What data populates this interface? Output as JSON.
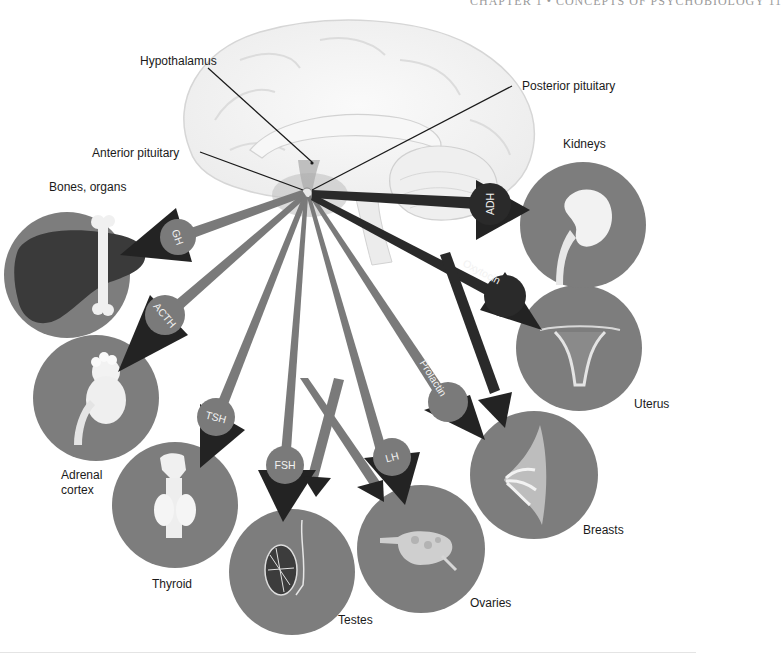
{
  "page": {
    "running_head": "CHAPTER 1 • CONCEPTS OF PSYCHOBIOLOGY    11"
  },
  "brain": {
    "labels": {
      "hypothalamus": "Hypothalamus",
      "anterior_pituitary": "Anterior pituitary",
      "posterior_pituitary": "Posterior pituitary"
    }
  },
  "colors": {
    "anterior_hormone": "#7a7a7a",
    "posterior_hormone": "#2a2a2a",
    "arrowhead": "#232323",
    "target_circle": "#7d7d7d",
    "brain_fill": "#f4f4f4",
    "brain_outline": "#d8d8d8",
    "label_text": "#1a1a1a"
  },
  "hormones": [
    {
      "id": "gh",
      "label": "GH",
      "source": "anterior",
      "target": "Bones, organs"
    },
    {
      "id": "acth",
      "label": "ACTH",
      "source": "anterior",
      "target": "Adrenal cortex"
    },
    {
      "id": "tsh",
      "label": "TSH",
      "source": "anterior",
      "target": "Thyroid"
    },
    {
      "id": "fsh",
      "label": "FSH",
      "source": "anterior",
      "target": "Testes / Ovaries"
    },
    {
      "id": "lh",
      "label": "LH",
      "source": "anterior",
      "target": "Ovaries / Testes"
    },
    {
      "id": "prolactin",
      "label": "Prolactin",
      "source": "anterior",
      "target": "Breasts"
    },
    {
      "id": "oxytocin",
      "label": "Oxytocin",
      "source": "posterior",
      "target": "Uterus / Breasts"
    },
    {
      "id": "adh",
      "label": "ADH",
      "source": "posterior",
      "target": "Kidneys"
    }
  ],
  "targets": {
    "bones": {
      "label": "Bones, organs"
    },
    "adrenal": {
      "label_line1": "Adrenal",
      "label_line2": "cortex"
    },
    "thyroid": {
      "label": "Thyroid"
    },
    "testes": {
      "label": "Testes"
    },
    "ovaries": {
      "label": "Ovaries"
    },
    "breasts": {
      "label": "Breasts"
    },
    "uterus": {
      "label": "Uterus"
    },
    "kidneys": {
      "label": "Kidneys"
    }
  }
}
